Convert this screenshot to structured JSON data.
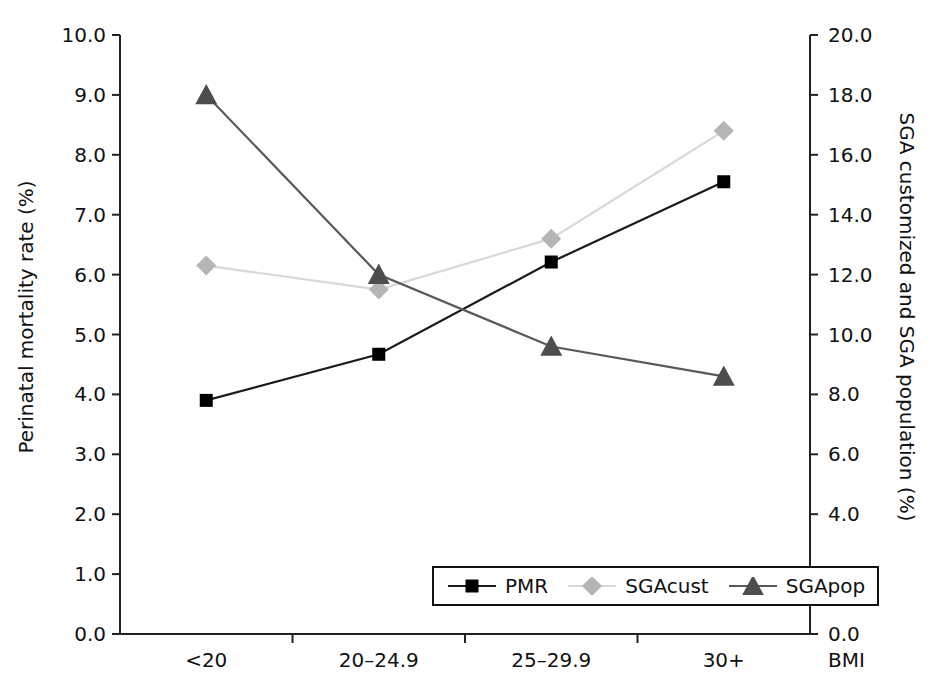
{
  "chart_data": {
    "type": "line",
    "title": "",
    "xlabel": "BMI",
    "categories": [
      "<20",
      "20–24.9",
      "25–29.9",
      "30+"
    ],
    "grid": false,
    "legend_position": "bottom-right",
    "axes": {
      "left": {
        "label": "Perinatal mortality rate (%)",
        "ylim": [
          0.0,
          10.0
        ],
        "step": 1.0,
        "ticks": [
          "0.0",
          "1.0",
          "2.0",
          "3.0",
          "4.0",
          "5.0",
          "6.0",
          "7.0",
          "8.0",
          "9.0",
          "10.0"
        ]
      },
      "right": {
        "label": "SGA customized and SGA population (%)",
        "ylim": [
          0.0,
          20.0
        ],
        "step": 2.0,
        "ticks": [
          "0.0",
          "2.0",
          "4.0",
          "6.0",
          "8.0",
          "10.0",
          "12.0",
          "14.0",
          "16.0",
          "18.0",
          "20.0"
        ]
      }
    },
    "series": [
      {
        "name": "PMR",
        "axis": "left",
        "marker": "square",
        "color": "#000000",
        "line_color": "#1a1a1a",
        "values": [
          3.9,
          4.67,
          6.21,
          7.55
        ]
      },
      {
        "name": "SGAcust",
        "axis": "right",
        "marker": "diamond",
        "color": "#b5b5b5",
        "line_color": "#d8d8d8",
        "values": [
          12.3,
          11.5,
          13.2,
          16.8
        ]
      },
      {
        "name": "SGApop",
        "axis": "right",
        "marker": "triangle",
        "color": "#4d4d4d",
        "line_color": "#595959",
        "values": [
          18.0,
          12.0,
          9.6,
          8.6
        ]
      }
    ]
  },
  "legend": {
    "items": [
      {
        "label": "PMR"
      },
      {
        "label": "SGAcust"
      },
      {
        "label": "SGApop"
      }
    ]
  }
}
